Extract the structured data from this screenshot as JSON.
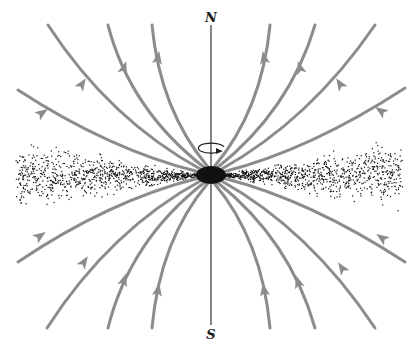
{
  "diagram": {
    "type": "magnetic field lines of a rotating star with accretion disk",
    "labels": {
      "north": "N",
      "south": "S"
    },
    "colors": {
      "field_line": "#8c8c8c",
      "axis": "#333333",
      "star": "#111111",
      "disk_dots": "#111111",
      "background": "#ffffff"
    },
    "axis": {
      "x": 211,
      "y_top": 25,
      "y_bottom": 325
    },
    "star": {
      "cx": 211,
      "cy": 175,
      "rx": 15,
      "ry": 9
    },
    "rotation_indicator": {
      "cx": 211,
      "cy": 147,
      "rx": 13,
      "ry": 5
    },
    "field_lines": [
      {
        "id": "ul1",
        "d": "M 199 172 Q 110 150 18 90",
        "arrow": [
          42,
          113,
          -35
        ]
      },
      {
        "id": "ul2",
        "d": "M 202 170 Q 110 120 48 25",
        "arrow": [
          82,
          84,
          -57
        ]
      },
      {
        "id": "ul3",
        "d": "M 205 168 Q 130 110 108 25",
        "arrow": [
          124,
          68,
          -72
        ]
      },
      {
        "id": "ul4",
        "d": "M 208 167 Q 160 110 152 25",
        "arrow": [
          158,
          58,
          -80
        ]
      },
      {
        "id": "ur1",
        "d": "M 214 167 Q 262 110 270 25",
        "arrow": [
          264,
          58,
          -100
        ]
      },
      {
        "id": "ur2",
        "d": "M 217 168 Q 290 110 315 25",
        "arrow": [
          300,
          68,
          -108
        ]
      },
      {
        "id": "ur3",
        "d": "M 220 170 Q 310 120 375 25",
        "arrow": [
          340,
          84,
          -123
        ]
      },
      {
        "id": "ur4",
        "d": "M 223 172 Q 310 150 405 88",
        "arrow": [
          381,
          111,
          -145
        ]
      },
      {
        "id": "ll1",
        "d": "M 18 262 Q 110 200 199 178",
        "arrow": [
          40,
          236,
          -35
        ]
      },
      {
        "id": "ll2",
        "d": "M 47 328 Q 110 230 202 180",
        "arrow": [
          84,
          262,
          -57
        ]
      },
      {
        "id": "ll3",
        "d": "M 108 328 Q 130 240 205 182",
        "arrow": [
          124,
          280,
          -72
        ]
      },
      {
        "id": "ll4",
        "d": "M 152 328 Q 160 240 208 183",
        "arrow": [
          158,
          290,
          -80
        ]
      },
      {
        "id": "lr1",
        "d": "M 214 183 Q 262 240 270 328",
        "arrow": [
          264,
          290,
          -100
        ]
      },
      {
        "id": "lr2",
        "d": "M 217 182 Q 290 240 315 328",
        "arrow": [
          298,
          282,
          -108
        ]
      },
      {
        "id": "lr3",
        "d": "M 220 180 Q 310 230 375 328",
        "arrow": [
          342,
          268,
          -123
        ]
      },
      {
        "id": "lr4",
        "d": "M 223 178 Q 310 200 405 262",
        "arrow": [
          382,
          238,
          -145
        ]
      }
    ],
    "disk": {
      "left": {
        "x_outer": 15,
        "x_inner": 198,
        "half_width_outer": 34,
        "half_width_inner": 2
      },
      "right": {
        "x_inner": 224,
        "x_outer": 402,
        "half_width_inner": 2,
        "half_width_outer": 34
      },
      "center_y": 175
    }
  }
}
